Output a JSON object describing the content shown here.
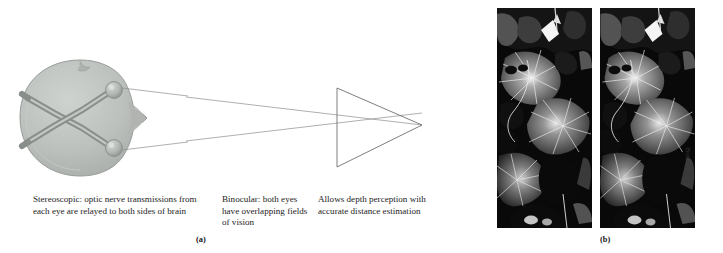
{
  "figure": {
    "panels": [
      {
        "key": "a",
        "label": "(a)"
      },
      {
        "key": "b",
        "label": "(b)"
      }
    ]
  },
  "panel_a": {
    "label": "(a)",
    "diagram": {
      "name": "stereoscopic-vision-head-diagram",
      "description": "Top-down view of a head showing optic nerves from both eyes crossing at the optic chiasm and relaying to both sides of the brain, with sight lines from each eye converging into an overlapping binocular field of vision",
      "head_fill": "#b8bcb8",
      "head_stroke": "#9a9e9a",
      "nerve_color": "#8a8e8a",
      "nerve_highlight": "#c9cdc9",
      "eye_fill": "#b2b6b2",
      "eye_stroke": "#8d918d",
      "sightline_color": "#8c8c8c",
      "field_triangle_color": "#6f6f6f"
    },
    "captions": [
      {
        "name": "caption-stereoscopic",
        "text": "Stereoscopic: optic nerve transmissions from each eye are relayed to both sides of brain"
      },
      {
        "name": "caption-binocular",
        "text": "Binocular: both eyes have overlapping fields of vision"
      },
      {
        "name": "caption-depth",
        "text": "Allows depth perception with accurate distance estimation"
      }
    ]
  },
  "panel_b": {
    "label": "(b)",
    "photos": [
      {
        "name": "stereo-photo-left",
        "description": "High-contrast black and white photograph of overlapping broad leaves with radiating veins, left image of a stereo pair"
      },
      {
        "name": "stereo-photo-right",
        "description": "High-contrast black and white photograph of overlapping broad leaves with radiating veins, right image of a stereo pair offset slightly for stereoscopic viewing"
      }
    ],
    "credit": "Bob Western"
  }
}
